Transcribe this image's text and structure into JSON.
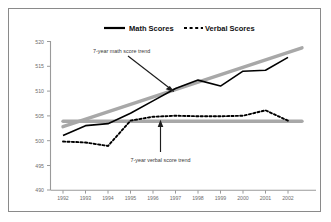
{
  "figure": {
    "background": "#ffffff",
    "border_color": "#8a8a8a"
  },
  "legend": {
    "position": "top-center",
    "entries": [
      {
        "label": "Math Scores",
        "style": "solid",
        "color": "#000000"
      },
      {
        "label": "Verbal Scores",
        "style": "dashed",
        "color": "#000000"
      }
    ]
  },
  "annotations": [
    {
      "name": "math-trend-annotation",
      "text": "7-year math score trend",
      "arrow": "diagonal-down-right"
    },
    {
      "name": "verbal-trend-annotation",
      "text": "7-year verbal score trend",
      "arrow": "vertical-up"
    }
  ],
  "chart_data": {
    "type": "line",
    "title": "",
    "xlabel": "",
    "ylabel": "",
    "x": [
      1992,
      1993,
      1994,
      1995,
      1996,
      1997,
      1998,
      1999,
      2000,
      2001,
      2002
    ],
    "categories": [
      "1992",
      "1993",
      "1994",
      "1995",
      "1996",
      "1997",
      "1998",
      "1999",
      "2000",
      "2001",
      "2002"
    ],
    "xlim": [
      1992,
      2002
    ],
    "ylim": [
      490,
      520
    ],
    "yticks": [
      490,
      495,
      500,
      505,
      510,
      515,
      520
    ],
    "ytick_labels": [
      "490",
      "495",
      "500",
      "505",
      "510",
      "515",
      "520"
    ],
    "grid": false,
    "series": [
      {
        "name": "Math Scores",
        "style": "solid",
        "color": "#000000",
        "values": [
          501,
          503,
          503.4,
          505.5,
          508,
          510.5,
          512.2,
          511,
          514,
          514.2,
          516.8
        ]
      },
      {
        "name": "Verbal Scores",
        "style": "dashed",
        "color": "#000000",
        "values": [
          499.8,
          499.6,
          498.9,
          504,
          504.8,
          505,
          504.9,
          504.9,
          505,
          506.1,
          504
        ]
      },
      {
        "name": "7-year math score trend",
        "style": "trend-solid-gray",
        "color": "#a8a8a8",
        "values": [
          502.8,
          504.3,
          505.8,
          507.3,
          508.8,
          510.3,
          511.8,
          513.3,
          514.8,
          516.3,
          517.8
        ]
      },
      {
        "name": "7-year verbal score trend",
        "style": "trend-solid-gray",
        "color": "#a8a8a8",
        "values": [
          503.9,
          503.9,
          503.9,
          503.9,
          503.9,
          503.9,
          503.9,
          503.9,
          503.9,
          503.9,
          503.9
        ]
      }
    ]
  }
}
